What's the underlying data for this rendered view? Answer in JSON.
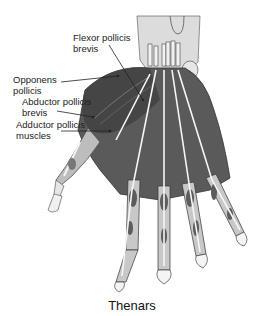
{
  "labels": [
    {
      "id": "flexor",
      "text": "Flexor pollicis\nbrevis"
    },
    {
      "id": "opponens",
      "text": "Opponens\npollicis"
    },
    {
      "id": "abductor",
      "text": "Abductor pollicis\nbrevis"
    },
    {
      "id": "adductor",
      "text": "Adductor pollicis\nmuscles"
    }
  ],
  "caption": "Thenars",
  "colors": {
    "muscle_dark": "#4a4a4a",
    "muscle_mid": "#7a7a7a",
    "skin_light": "#d8d8d8",
    "tendon": "#f4f4f4",
    "outline": "#333333",
    "leader_line": "#222222"
  }
}
